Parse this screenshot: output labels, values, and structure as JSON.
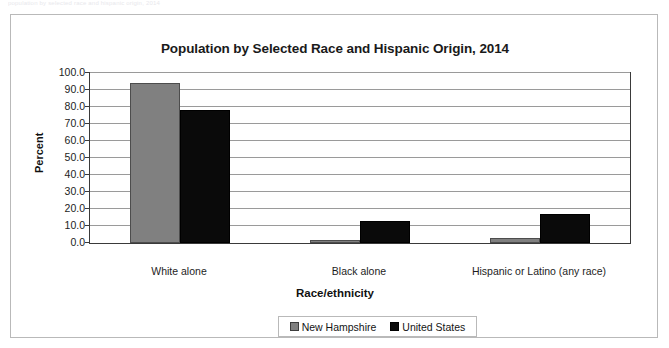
{
  "page": {
    "faint_header_text": "population by selected race and hispanic origin, 2014"
  },
  "chart_data": {
    "type": "bar",
    "title": "Population by Selected Race and Hispanic Origin, 2014",
    "xlabel": "Race/ethnicity",
    "ylabel": "Percent",
    "categories": [
      "White alone",
      "Black alone",
      "Hispanic or Latino (any race)"
    ],
    "series": [
      {
        "name": "New Hampshire",
        "color": "#808080",
        "values": [
          94.0,
          1.5,
          3.0
        ]
      },
      {
        "name": "United States",
        "color": "#0a0a0a",
        "values": [
          78.0,
          13.0,
          17.0
        ]
      }
    ],
    "ylim": [
      0,
      100
    ],
    "ytick_labels": [
      "0.0",
      "10.0",
      "20.0",
      "30.0",
      "40.0",
      "50.0",
      "60.0",
      "70.0",
      "80.0",
      "90.0",
      "100.0"
    ],
    "ytick_step": 10,
    "grid": true,
    "legend_position": "bottom",
    "legend": [
      {
        "label": "New Hampshire",
        "swatch": "gray-square-icon"
      },
      {
        "label": "United States",
        "swatch": "black-square-icon"
      }
    ]
  }
}
